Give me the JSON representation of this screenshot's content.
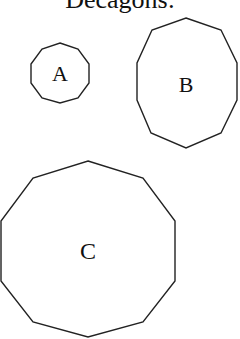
{
  "title": "Decagons:",
  "shapes": [
    {
      "label": "A",
      "sides": 10,
      "cx": 60,
      "cy": 73,
      "rx": 31,
      "ry": 30
    },
    {
      "label": "B",
      "sides": 10,
      "cx": 186,
      "cy": 84,
      "rx": 51,
      "ry": 64
    },
    {
      "label": "C",
      "sides": 10,
      "cx": 88,
      "cy": 251,
      "rx": 88,
      "ry": 88
    }
  ],
  "colors": {
    "stroke": "#222222",
    "background": "#ffffff"
  }
}
